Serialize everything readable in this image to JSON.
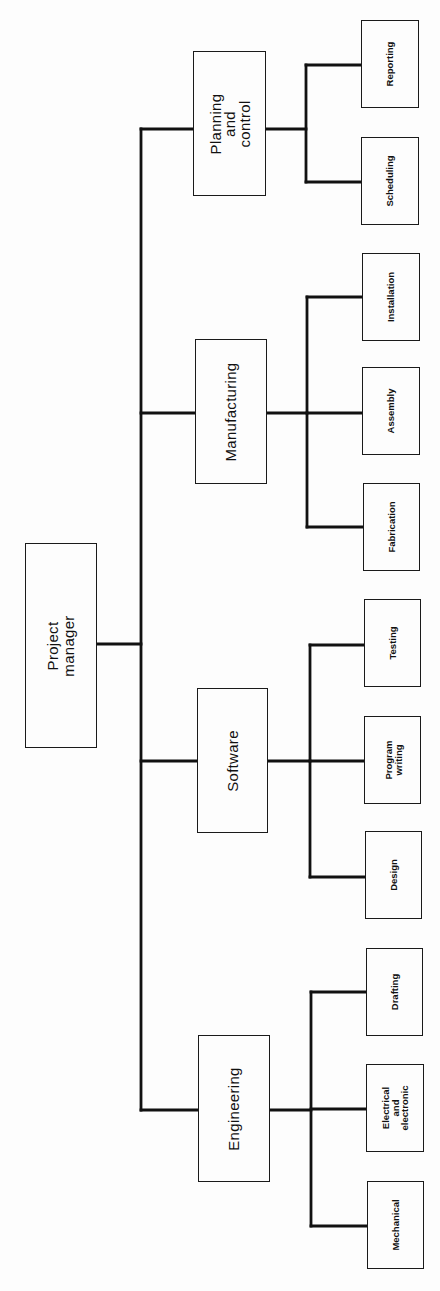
{
  "diagram": {
    "orientation": "rotated-90-ccw",
    "colors": {
      "background": "#fdfdfd",
      "line": "#111111",
      "box_border": "#1a1a1a",
      "text": "#111111"
    },
    "root": {
      "id": "project-manager",
      "label": "Project\nmanager",
      "box": {
        "x": 25,
        "y": 543,
        "w": 72,
        "h": 205
      }
    },
    "departments": [
      {
        "id": "planning-and-control",
        "label": "Planning\nand\ncontrol",
        "box": {
          "x": 193,
          "y": 51,
          "w": 73,
          "h": 145
        },
        "connect_y": 129,
        "bus_x": 306,
        "children": [
          {
            "id": "reporting",
            "label": "Reporting",
            "box": {
              "x": 361,
              "y": 20,
              "w": 58,
              "h": 88
            },
            "connect_y": 65
          },
          {
            "id": "scheduling",
            "label": "Scheduling",
            "box": {
              "x": 361,
              "y": 137,
              "w": 58,
              "h": 88
            },
            "connect_y": 182
          }
        ]
      },
      {
        "id": "manufacturing",
        "label": "Manufacturing",
        "box": {
          "x": 195,
          "y": 339,
          "w": 72,
          "h": 145
        },
        "connect_y": 413,
        "bus_x": 307,
        "children": [
          {
            "id": "installation",
            "label": "Installation",
            "box": {
              "x": 362,
              "y": 253,
              "w": 58,
              "h": 88
            },
            "connect_y": 297
          },
          {
            "id": "assembly",
            "label": "Assembly",
            "box": {
              "x": 362,
              "y": 367,
              "w": 58,
              "h": 88
            },
            "connect_y": 413
          },
          {
            "id": "fabrication",
            "label": "Fabrication",
            "box": {
              "x": 363,
              "y": 483,
              "w": 57,
              "h": 88
            },
            "connect_y": 527
          }
        ]
      },
      {
        "id": "software",
        "label": "Software",
        "box": {
          "x": 197,
          "y": 688,
          "w": 71,
          "h": 145
        },
        "connect_y": 761,
        "bus_x": 310,
        "children": [
          {
            "id": "testing",
            "label": "Testing",
            "box": {
              "x": 364,
              "y": 599,
              "w": 57,
              "h": 88
            },
            "connect_y": 645
          },
          {
            "id": "program-writing",
            "label": "Program\nwriting",
            "box": {
              "x": 364,
              "y": 716,
              "w": 57,
              "h": 88
            },
            "connect_y": 761
          },
          {
            "id": "design",
            "label": "Design",
            "box": {
              "x": 365,
              "y": 831,
              "w": 57,
              "h": 88
            },
            "connect_y": 877
          }
        ]
      },
      {
        "id": "engineering",
        "label": "Engineering",
        "box": {
          "x": 198,
          "y": 1035,
          "w": 72,
          "h": 147
        },
        "connect_y": 1110,
        "bus_x": 311,
        "children": [
          {
            "id": "drafting",
            "label": "Drafting",
            "box": {
              "x": 366,
              "y": 948,
              "w": 57,
              "h": 88
            },
            "connect_y": 992
          },
          {
            "id": "electrical-and-electronic",
            "label": "Electrical\nand\nelectronic",
            "box": {
              "x": 366,
              "y": 1064,
              "w": 58,
              "h": 88
            },
            "connect_y": 1109
          },
          {
            "id": "mechanical",
            "label": "Mechanical",
            "box": {
              "x": 367,
              "y": 1181,
              "w": 57,
              "h": 88
            },
            "connect_y": 1226
          }
        ]
      }
    ],
    "trunk": {
      "x": 141,
      "y_top": 129,
      "y_bottom": 1110,
      "root_connect_y": 644
    }
  }
}
